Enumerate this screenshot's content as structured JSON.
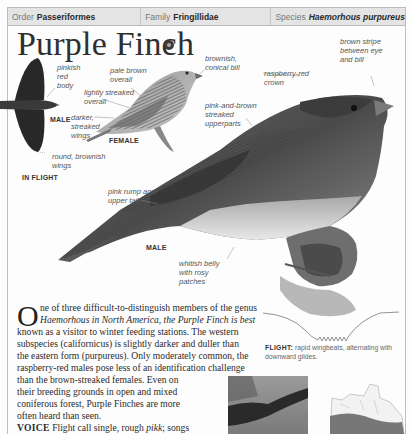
{
  "taxonomy": {
    "order_label": "Order",
    "order_value": "Passeriformes",
    "family_label": "Family",
    "family_value": "Fringillidae",
    "species_label": "Species",
    "species_value": "Haemorhous purpureus"
  },
  "title": "Purple Finch",
  "audio_icon": "audio-icon",
  "illustrations": {
    "in_flight": {
      "caption": "IN FLIGHT",
      "sex_label": "MALE",
      "labels": [
        "pinkish red body",
        "round, brownish wings"
      ]
    },
    "female": {
      "caption": "FEMALE",
      "labels": [
        "pale brown overall",
        "lightly streaked overall",
        "darker, streaked wings"
      ]
    },
    "male": {
      "caption": "MALE",
      "labels": [
        "brownish, conical bill",
        "brown stripe between eye and bill",
        "raspberry-red crown",
        "pink-and-brown streaked upperparts",
        "pink rump and upper tail",
        "whitish belly with rosy patches"
      ]
    }
  },
  "label_lines": {
    "pinkish": [
      "pinkish",
      "red",
      "body"
    ],
    "round_wings": [
      "round, brownish",
      "wings"
    ],
    "pale_brown": [
      "pale brown",
      "overall"
    ],
    "lightly_streaked": [
      "lightly streaked",
      "overall"
    ],
    "darker_wings": [
      "darker,",
      "streaked",
      "wings"
    ],
    "conical_bill": [
      "brownish,",
      "conical bill"
    ],
    "brown_stripe": [
      "brown stripe",
      "between eye",
      "and bill"
    ],
    "crown": [
      "raspberry-red",
      "crown"
    ],
    "upperparts": [
      "pink-and-brown",
      "streaked",
      "upperparts"
    ],
    "rump": [
      "pink rump and",
      "upper tail"
    ],
    "belly": [
      "whitish belly",
      "with rosy",
      "patches"
    ]
  },
  "description": {
    "dropcap": "O",
    "lines": [
      "ne of three difficult-to-distinguish members of the genus",
      "Haemorhous in North America, the Purple Finch is best",
      "known as a visitor to winter feeding stations. The western",
      "subspecies (californicus) is slightly darker and duller than",
      "the eastern form (purpureus). Only moderately common, the",
      "raspberry-red males pose less of an identification challenge",
      "than the brown-streaked females. Even on",
      "their breeding grounds in open and mixed",
      "coniferous forest, Purple Finches are more",
      "often heard than seen."
    ],
    "voice_label": "VOICE",
    "voice_text_1": " Flight call single, rough ",
    "voice_call": "pikk",
    "voice_text_2": "; songs",
    "voice_line_2": "rich series of notes, up and down in pitch."
  },
  "flight": {
    "label": "FLIGHT:",
    "text": " rapid wingbeats, alternating with downward glides."
  },
  "thumbnails": {
    "photo": "habitat-photo",
    "map": "range-map"
  }
}
